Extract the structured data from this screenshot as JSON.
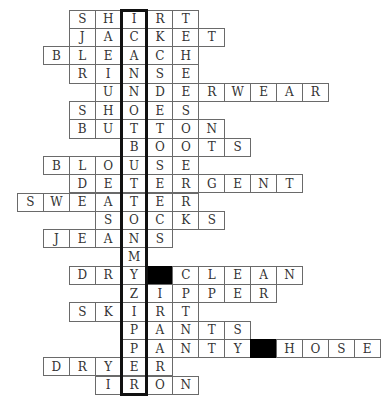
{
  "puzzle": {
    "type": "crossword-word-ladder",
    "theme_column_index": 4,
    "theme_word": "ICANNOTBUTTONSMYZIPPER",
    "block_color": "#000000",
    "border_color": "#6a6a6a",
    "highlight_border_color": "#111111",
    "rows": [
      {
        "word": "SHIRT",
        "start_col": 2,
        "cells": [
          "S",
          "H",
          "I",
          "R",
          "T"
        ]
      },
      {
        "word": "JACKET",
        "start_col": 2,
        "cells": [
          "J",
          "A",
          "C",
          "K",
          "E",
          "T"
        ]
      },
      {
        "word": "BLEACH",
        "start_col": 1,
        "cells": [
          "B",
          "L",
          "E",
          "A",
          "C",
          "H"
        ]
      },
      {
        "word": "RINSE",
        "start_col": 2,
        "cells": [
          "R",
          "I",
          "N",
          "S",
          "E"
        ]
      },
      {
        "word": "UNDERWEAR",
        "start_col": 3,
        "cells": [
          "U",
          "N",
          "D",
          "E",
          "R",
          "W",
          "E",
          "A",
          "R"
        ]
      },
      {
        "word": "SHOES",
        "start_col": 2,
        "cells": [
          "S",
          "H",
          "O",
          "E",
          "S"
        ]
      },
      {
        "word": "BUTTON",
        "start_col": 2,
        "cells": [
          "B",
          "U",
          "T",
          "T",
          "O",
          "N"
        ]
      },
      {
        "word": "BOOTS",
        "start_col": 4,
        "cells": [
          "B",
          "O",
          "O",
          "T",
          "S"
        ]
      },
      {
        "word": "BLOUSE",
        "start_col": 1,
        "cells": [
          "B",
          "L",
          "O",
          "U",
          "S",
          "E"
        ]
      },
      {
        "word": "DETERGENT",
        "start_col": 2,
        "cells": [
          "D",
          "E",
          "T",
          "E",
          "R",
          "G",
          "E",
          "N",
          "T"
        ]
      },
      {
        "word": "SWEATER",
        "start_col": 0,
        "cells": [
          "S",
          "W",
          "E",
          "A",
          "T",
          "E",
          "R"
        ]
      },
      {
        "word": "SOCKS",
        "start_col": 3,
        "cells": [
          "S",
          "O",
          "C",
          "K",
          "S"
        ]
      },
      {
        "word": "JEANS",
        "start_col": 1,
        "cells": [
          "J",
          "E",
          "A",
          "N",
          "S"
        ]
      },
      {
        "word": "M",
        "start_col": 4,
        "cells": [
          "M"
        ]
      },
      {
        "word": "DRY CLEAN",
        "start_col": 2,
        "cells": [
          "D",
          "R",
          "Y",
          "#",
          "C",
          "L",
          "E",
          "A",
          "N"
        ]
      },
      {
        "word": "ZIPPER",
        "start_col": 4,
        "cells": [
          "Z",
          "I",
          "P",
          "P",
          "E",
          "R"
        ]
      },
      {
        "word": "SKIRT",
        "start_col": 2,
        "cells": [
          "S",
          "K",
          "I",
          "R",
          "T"
        ]
      },
      {
        "word": "PANTS",
        "start_col": 4,
        "cells": [
          "P",
          "A",
          "N",
          "T",
          "S"
        ]
      },
      {
        "word": "PANTY HOSE",
        "start_col": 4,
        "cells": [
          "P",
          "A",
          "N",
          "T",
          "Y",
          "#",
          "H",
          "O",
          "S",
          "E"
        ]
      },
      {
        "word": "DRYER",
        "start_col": 1,
        "cells": [
          "D",
          "R",
          "Y",
          "E",
          "R"
        ]
      },
      {
        "word": "IRON",
        "start_col": 3,
        "cells": [
          "I",
          "R",
          "O",
          "N"
        ]
      }
    ]
  }
}
